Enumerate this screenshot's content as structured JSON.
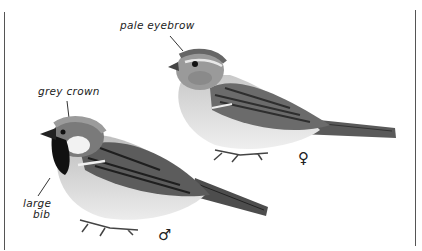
{
  "illustration": {
    "subject": "House Sparrow male and female",
    "labels": {
      "pale_eyebrow": "pale eyebrow",
      "grey_crown": "grey crown",
      "large_bib_line1": "large",
      "large_bib_line2": "bib"
    },
    "sex_symbols": {
      "female": "♀",
      "male": "♂"
    }
  }
}
